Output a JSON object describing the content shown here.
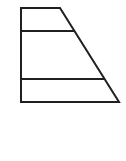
{
  "figure": {
    "shape_name": "right-trapezoid",
    "background_color": "#ffffff",
    "stroke_color": "#231f20",
    "stroke_width": 2,
    "canvas": {
      "width": 126,
      "height": 161
    },
    "outline": {
      "name": "trapezoid-outline",
      "points": "21,8 60,8 119,102 21,102",
      "vertices": [
        {
          "label": "top-left",
          "x": 21,
          "y": 8
        },
        {
          "label": "top-right",
          "x": 60,
          "y": 8
        },
        {
          "label": "bottom-right",
          "x": 119,
          "y": 102
        },
        {
          "label": "bottom-left",
          "x": 21,
          "y": 102
        }
      ]
    },
    "dividers": [
      {
        "name": "upper-divider",
        "x1": 21,
        "y1": 31,
        "x2": 74,
        "y2": 31
      },
      {
        "name": "lower-divider",
        "x1": 21,
        "y1": 79,
        "x2": 104,
        "y2": 79
      }
    ],
    "bands": [
      {
        "name": "top-band",
        "order": 1
      },
      {
        "name": "middle-band",
        "order": 2
      },
      {
        "name": "bottom-band",
        "order": 3
      }
    ]
  }
}
